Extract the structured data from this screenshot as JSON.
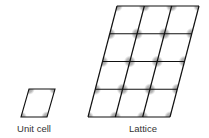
{
  "figure": {
    "unit_cell": {
      "label": "Unit cell",
      "corners": [
        [
          29,
          89
        ],
        [
          55,
          89
        ],
        [
          47,
          117
        ],
        [
          21,
          117
        ]
      ],
      "label_x": 34,
      "label_y": 123
    },
    "lattice": {
      "label": "Lattice",
      "columns": 3,
      "rows": 4,
      "origin_top_left": [
        117,
        6
      ],
      "origin_bottom_left": [
        88,
        117
      ],
      "column_spacing": 27.33,
      "label_x": 143,
      "label_y": 123
    },
    "colors": {
      "line": "#111111",
      "atom": "#808080",
      "text": "#333333"
    }
  }
}
